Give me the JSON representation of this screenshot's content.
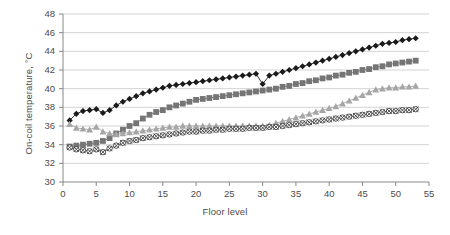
{
  "chart_data": {
    "type": "line",
    "title": "",
    "xlabel": "Floor level",
    "ylabel": "On-coil temperature, °C",
    "xlim": [
      0,
      55
    ],
    "ylim": [
      30,
      48
    ],
    "xticks": [
      0,
      5,
      10,
      15,
      20,
      25,
      30,
      35,
      40,
      45,
      50,
      55
    ],
    "yticks": [
      30,
      32,
      34,
      36,
      38,
      40,
      42,
      44,
      46,
      48
    ],
    "grid": "horizontal",
    "legend": "none",
    "x": [
      1,
      2,
      3,
      4,
      5,
      6,
      7,
      8,
      9,
      10,
      11,
      12,
      13,
      14,
      15,
      16,
      17,
      18,
      19,
      20,
      21,
      22,
      23,
      24,
      25,
      26,
      27,
      28,
      29,
      30,
      31,
      32,
      33,
      34,
      35,
      36,
      37,
      38,
      39,
      40,
      41,
      42,
      43,
      44,
      45,
      46,
      47,
      48,
      49,
      50,
      51,
      52,
      53
    ],
    "series": [
      {
        "name": "Series 1",
        "marker": "filled-diamond",
        "color": "#1a1a1a",
        "values": [
          36.6,
          37.3,
          37.6,
          37.7,
          37.8,
          37.4,
          37.7,
          38.2,
          38.6,
          38.9,
          39.2,
          39.5,
          39.7,
          39.9,
          40.1,
          40.3,
          40.4,
          40.5,
          40.6,
          40.7,
          40.8,
          40.9,
          41.0,
          41.1,
          41.2,
          41.3,
          41.4,
          41.5,
          41.6,
          40.5,
          41.4,
          41.6,
          41.8,
          42.0,
          42.2,
          42.4,
          42.6,
          42.8,
          43.0,
          43.2,
          43.4,
          43.6,
          43.8,
          44.0,
          44.2,
          44.4,
          44.6,
          44.8,
          44.9,
          45.0,
          45.2,
          45.3,
          45.4
        ]
      },
      {
        "name": "Series 2",
        "marker": "filled-square",
        "color": "#757575",
        "values": [
          33.8,
          33.9,
          34.0,
          34.1,
          34.2,
          34.4,
          34.7,
          35.2,
          35.6,
          36.0,
          36.3,
          36.8,
          37.2,
          37.5,
          37.7,
          38.0,
          38.2,
          38.4,
          38.6,
          38.8,
          38.9,
          39.0,
          39.1,
          39.2,
          39.3,
          39.4,
          39.5,
          39.6,
          39.7,
          39.8,
          39.9,
          40.0,
          40.2,
          40.3,
          40.5,
          40.6,
          40.8,
          40.9,
          41.1,
          41.2,
          41.4,
          41.5,
          41.7,
          41.8,
          42.0,
          42.1,
          42.3,
          42.4,
          42.6,
          42.7,
          42.8,
          42.9,
          43.0
        ]
      },
      {
        "name": "Series 3",
        "marker": "filled-triangle",
        "color": "#a6a6a6",
        "values": [
          36.2,
          35.8,
          35.7,
          35.6,
          35.9,
          35.4,
          35.2,
          35.1,
          35.2,
          35.3,
          35.4,
          35.5,
          35.6,
          35.7,
          35.8,
          35.9,
          35.9,
          36.0,
          36.0,
          36.0,
          36.0,
          36.0,
          36.0,
          36.0,
          36.0,
          36.0,
          36.0,
          36.0,
          36.0,
          36.0,
          36.1,
          36.3,
          36.5,
          36.7,
          36.9,
          37.1,
          37.3,
          37.5,
          37.7,
          37.9,
          38.1,
          38.4,
          38.7,
          39.0,
          39.3,
          39.6,
          39.9,
          40.0,
          40.1,
          40.1,
          40.2,
          40.2,
          40.3
        ]
      },
      {
        "name": "Series 4",
        "marker": "open-circle-x",
        "color": "#404040",
        "values": [
          33.7,
          33.5,
          33.4,
          33.3,
          33.5,
          33.2,
          33.6,
          33.9,
          34.2,
          34.4,
          34.5,
          34.7,
          34.8,
          34.9,
          35.0,
          35.1,
          35.2,
          35.3,
          35.4,
          35.4,
          35.5,
          35.5,
          35.6,
          35.6,
          35.7,
          35.7,
          35.7,
          35.8,
          35.8,
          35.8,
          35.9,
          35.9,
          36.0,
          36.1,
          36.2,
          36.3,
          36.4,
          36.5,
          36.6,
          36.7,
          36.8,
          36.9,
          37.0,
          37.1,
          37.2,
          37.3,
          37.4,
          37.5,
          37.6,
          37.6,
          37.7,
          37.7,
          37.8
        ]
      }
    ]
  }
}
